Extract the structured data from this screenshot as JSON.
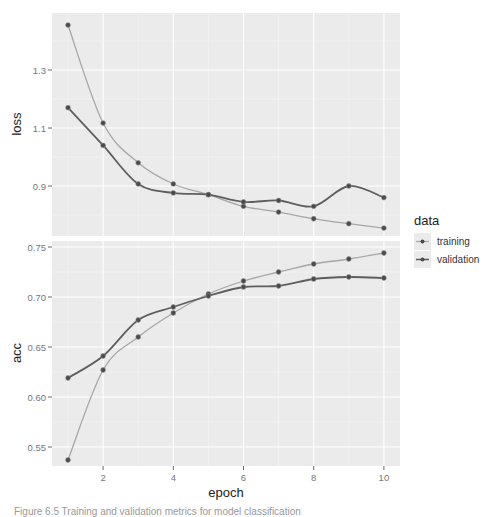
{
  "chart_data": [
    {
      "type": "line",
      "panel": "loss",
      "ylabel": "loss",
      "xlabel": "epoch",
      "x": [
        1,
        2,
        3,
        4,
        5,
        6,
        7,
        8,
        9,
        10
      ],
      "yticks": [
        0.9,
        1.1,
        1.3
      ],
      "ylim": [
        0.73,
        1.48
      ],
      "series": [
        {
          "name": "training",
          "values": [
            1.455,
            1.117,
            0.98,
            0.907,
            0.87,
            0.83,
            0.81,
            0.787,
            0.77,
            0.755
          ]
        },
        {
          "name": "validation",
          "values": [
            1.17,
            1.04,
            0.907,
            0.876,
            0.87,
            0.845,
            0.85,
            0.83,
            0.9,
            0.86
          ]
        }
      ],
      "grid": true
    },
    {
      "type": "line",
      "panel": "acc",
      "ylabel": "acc",
      "xlabel": "epoch",
      "x": [
        1,
        2,
        3,
        4,
        5,
        6,
        7,
        8,
        9,
        10
      ],
      "yticks": [
        0.55,
        0.6,
        0.65,
        0.7,
        0.75
      ],
      "ylim": [
        0.531,
        0.756
      ],
      "series": [
        {
          "name": "training",
          "values": [
            0.537,
            0.627,
            0.66,
            0.684,
            0.703,
            0.716,
            0.725,
            0.733,
            0.738,
            0.744
          ]
        },
        {
          "name": "validation",
          "values": [
            0.619,
            0.641,
            0.677,
            0.69,
            0.701,
            0.71,
            0.711,
            0.718,
            0.72,
            0.719
          ]
        }
      ],
      "grid": true
    }
  ],
  "axes": {
    "xlabel": "epoch",
    "xticks": [
      "2",
      "4",
      "6",
      "8",
      "10"
    ],
    "loss_label": "loss",
    "acc_label": "acc",
    "loss_ticks": [
      "1.3",
      "1.1",
      "0.9"
    ],
    "acc_ticks": [
      "0.75",
      "0.70",
      "0.65",
      "0.60",
      "0.55"
    ]
  },
  "legend": {
    "title": "data",
    "items": [
      {
        "label": "training",
        "color": "#a6a6a6"
      },
      {
        "label": "validation",
        "color": "#5e5e5e"
      }
    ]
  },
  "colors": {
    "panel_bg": "#ebebeb",
    "grid": "#ffffff",
    "training": "#a6a6a6",
    "validation": "#5e5e5e",
    "point": "#4a4a4a"
  },
  "caption": "Figure 6.5  Training and validation metrics for model classification"
}
